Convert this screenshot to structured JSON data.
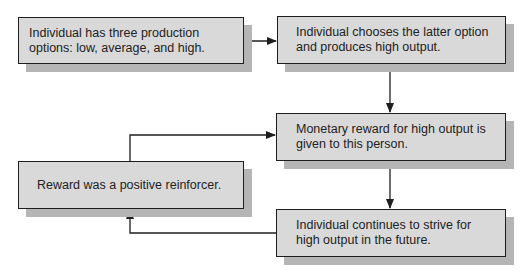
{
  "diagram": {
    "type": "flowchart",
    "colors": {
      "box_fill": "#d9d9d9",
      "box_border": "#1e1e1e",
      "shadow": "#b5b5b5",
      "line": "#1e1e1e",
      "text": "#222222"
    },
    "nodes": [
      {
        "id": "options",
        "text": "Individual has three production options: low, average, and high."
      },
      {
        "id": "choice",
        "text": "Individual chooses the latter option and produces high output."
      },
      {
        "id": "reward",
        "text": "Monetary reward for high output is given to this person."
      },
      {
        "id": "reinforcer",
        "text": "Reward was a positive reinforcer."
      },
      {
        "id": "continue",
        "text": "Individual continues to strive for high output in the future."
      }
    ],
    "edges": [
      {
        "from": "options",
        "to": "choice"
      },
      {
        "from": "choice",
        "to": "reward"
      },
      {
        "from": "reward",
        "to": "continue"
      },
      {
        "from": "continue",
        "to": "reinforcer"
      },
      {
        "from": "reinforcer",
        "to": "reward"
      }
    ]
  }
}
